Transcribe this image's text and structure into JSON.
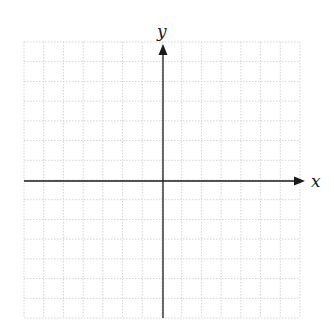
{
  "diagram": {
    "type": "coordinate-plane",
    "x_axis_label": "x",
    "y_axis_label": "y",
    "grid": {
      "left": 24,
      "top": 42,
      "right": 300,
      "bottom": 318,
      "cell_size": 19.7,
      "columns": 14,
      "rows": 14,
      "line_color": "#d4d4d4",
      "line_style": "dotted"
    },
    "origin": {
      "x": 163,
      "y": 181
    },
    "axis_color": "#1a1a1a",
    "x_axis": {
      "start_x": 24,
      "end_x": 305
    },
    "y_axis": {
      "start_y": 318,
      "end_y": 44
    }
  }
}
